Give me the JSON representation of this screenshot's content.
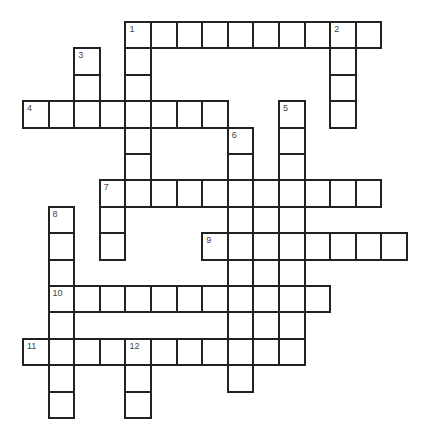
{
  "puzzle": {
    "type": "crossword",
    "grid": {
      "origin_x": 23,
      "origin_y": 22,
      "col_pitch": 25.6,
      "row_pitch": 26.4,
      "columns": 15,
      "rows": 15,
      "line_color": "#222222",
      "cell_color": "#ffffff"
    },
    "filled_cells": [
      {
        "r": 0,
        "c": [
          4,
          5,
          6,
          7,
          8,
          9,
          10,
          11,
          12,
          13
        ]
      },
      {
        "r": 1,
        "c": [
          2,
          4,
          12
        ]
      },
      {
        "r": 2,
        "c": [
          2,
          4,
          12
        ]
      },
      {
        "r": 3,
        "c": [
          0,
          1,
          2,
          3,
          4,
          5,
          6,
          7,
          10,
          12
        ]
      },
      {
        "r": 4,
        "c": [
          4,
          8,
          10
        ]
      },
      {
        "r": 5,
        "c": [
          4,
          8,
          10
        ]
      },
      {
        "r": 6,
        "c": [
          3,
          4,
          5,
          6,
          7,
          8,
          9,
          10,
          11,
          12,
          13
        ]
      },
      {
        "r": 7,
        "c": [
          1,
          3,
          8,
          9,
          10
        ]
      },
      {
        "r": 8,
        "c": [
          1,
          3,
          7,
          8,
          9,
          10,
          11,
          12,
          13,
          14
        ]
      },
      {
        "r": 9,
        "c": [
          1,
          8,
          9,
          10
        ]
      },
      {
        "r": 10,
        "c": [
          1,
          2,
          3,
          4,
          5,
          6,
          7,
          8,
          9,
          10,
          11
        ]
      },
      {
        "r": 11,
        "c": [
          1,
          8,
          9,
          10
        ]
      },
      {
        "r": 12,
        "c": [
          0,
          1,
          2,
          3,
          4,
          5,
          6,
          7,
          8,
          9,
          10
        ]
      },
      {
        "r": 13,
        "c": [
          1,
          4,
          8
        ]
      },
      {
        "r": 14,
        "c": [
          1,
          4
        ]
      }
    ],
    "clue_numbers": [
      {
        "n": "1",
        "r": 0,
        "c": 4
      },
      {
        "n": "2",
        "r": 0,
        "c": 12
      },
      {
        "n": "3",
        "r": 1,
        "c": 2
      },
      {
        "n": "4",
        "r": 3,
        "c": 0
      },
      {
        "n": "5",
        "r": 3,
        "c": 10
      },
      {
        "n": "6",
        "r": 4,
        "c": 8
      },
      {
        "n": "7",
        "r": 6,
        "c": 3
      },
      {
        "n": "8",
        "r": 7,
        "c": 1
      },
      {
        "n": "9",
        "r": 8,
        "c": 7
      },
      {
        "n": "10",
        "r": 10,
        "c": 1
      },
      {
        "n": "11",
        "r": 12,
        "c": 0
      },
      {
        "n": "12",
        "r": 12,
        "c": 4
      }
    ]
  }
}
